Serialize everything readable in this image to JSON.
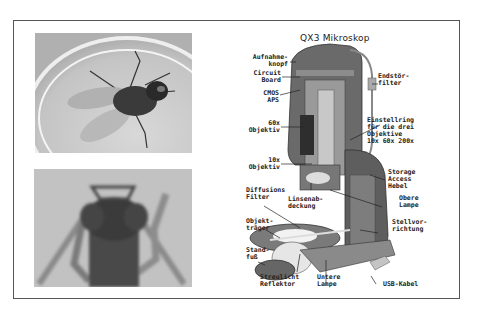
{
  "title": "QX3 Mikroskop",
  "photos": [
    {
      "subject": "fly-in-petri-dish"
    },
    {
      "subject": "insect-head-closeup"
    }
  ],
  "labels": {
    "aufnahmeknopf": "Aufnahme-\nknopf",
    "circuit_board": "Circuit\nBoard",
    "cmos_aps": "CMOS\nAPS",
    "objektiv_60x": "60x\nObjektiv",
    "objektiv_10x": "10x\nObjektiv",
    "diffusions_filter": "Diffusions\nFilter",
    "linsenabdeckung": "Linsenab-\ndeckung",
    "objekttraeger": "Objekt-\nträger",
    "standfuss": "Stand-\nfuß",
    "streulicht_reflektor": "Streulicht\nReflektor",
    "untere_lampe": "Untere\nLampe",
    "usb_kabel": "USB-Kabel",
    "stellvorrichtung": "Stellvor-\nrichtung",
    "obere_lampe": "Obere\nLampe",
    "storage_access_hebel": "Storage\nAccess\nHebel",
    "einstellring": "Einstellring\nfür die drei\nObjektive\n10x 60x 200x",
    "endstorfilter": "Endstör-\nfilter"
  },
  "colors": {
    "border": "#555555",
    "text": "#222222",
    "body_dark": "#5a5a5a",
    "body_mid": "#8a8a8a",
    "photo_bg": "#bdbdbd"
  }
}
